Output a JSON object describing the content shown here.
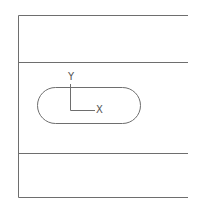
{
  "diagram": {
    "type": "cad-sketch",
    "stroke_color": "#6e6e6e",
    "label_color": "#555555",
    "frame": {
      "left_x": 18,
      "right_x": 188,
      "top_y": 15,
      "bottom_y": 197,
      "horizontal_lines_y": [
        15,
        62,
        153,
        197
      ]
    },
    "slot": {
      "shape": "obround",
      "left_x": 37,
      "right_x": 140,
      "top_y": 87,
      "bottom_y": 123
    },
    "axes": {
      "origin": [
        70,
        110
      ],
      "y_end": [
        70,
        84
      ],
      "x_end": [
        95,
        110
      ],
      "x_label": "X",
      "y_label": "Y"
    }
  }
}
